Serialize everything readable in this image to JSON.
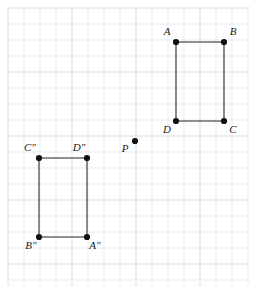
{
  "figure": {
    "background_color": "#ffffff",
    "grid": {
      "line_color": "#e7e9ef",
      "major_line_color": "#dcdee6",
      "cell_size": 16,
      "x_start": 8,
      "y_start": 8,
      "x_end": 250,
      "y_end": 286
    },
    "style": {
      "segment_color": "#6a6a72",
      "segment_width": 1.6,
      "vertex_color": "#111114",
      "vertex_radius": 3.1,
      "label_color": "#1a1a1a",
      "label_font_size": 11
    }
  },
  "shapes": [
    {
      "name": "rectangle-abcd",
      "closed": true,
      "vertices": [
        {
          "id": "A",
          "label": "A",
          "x": 176,
          "y": 42,
          "label_x": 167,
          "label_y": 35,
          "label_anchor": "middle"
        },
        {
          "id": "B",
          "label": "B",
          "x": 224,
          "y": 42,
          "label_x": 233,
          "label_y": 35,
          "label_anchor": "middle"
        },
        {
          "id": "C",
          "label": "C",
          "x": 224,
          "y": 121,
          "label_x": 233,
          "label_y": 133,
          "label_anchor": "middle"
        },
        {
          "id": "D",
          "label": "D",
          "x": 176,
          "y": 121,
          "label_x": 167,
          "label_y": 133,
          "label_anchor": "middle"
        }
      ]
    },
    {
      "name": "rectangle-abcd-double-prime",
      "closed": true,
      "vertices": [
        {
          "id": "C2",
          "label": "C″",
          "x": 39,
          "y": 158,
          "label_x": 30,
          "label_y": 151,
          "label_anchor": "middle"
        },
        {
          "id": "D2",
          "label": "D″",
          "x": 87,
          "y": 158,
          "label_x": 79,
          "label_y": 151,
          "label_anchor": "middle"
        },
        {
          "id": "A2",
          "label": "A″",
          "x": 87,
          "y": 237,
          "label_x": 95,
          "label_y": 249,
          "label_anchor": "middle"
        },
        {
          "id": "B2",
          "label": "B″",
          "x": 39,
          "y": 237,
          "label_x": 31,
          "label_y": 249,
          "label_anchor": "middle"
        }
      ]
    }
  ],
  "points": [
    {
      "id": "P",
      "name": "point-p",
      "label": "P",
      "x": 135,
      "y": 141,
      "label_x": 125,
      "label_y": 152,
      "label_anchor": "middle"
    }
  ]
}
